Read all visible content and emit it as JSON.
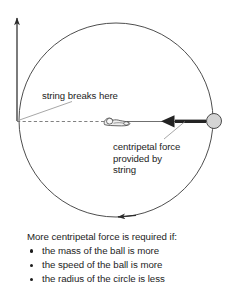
{
  "figure": {
    "title_present": false,
    "annotations": {
      "string_breaks": "string breaks here",
      "centripetal_force_line1": "centripetal force",
      "centripetal_force_line2": "provided by",
      "centripetal_force_line3": "string"
    },
    "elements": {
      "circle_path_name": "circular path of ball",
      "ball_name": "ball",
      "hand_name": "hand holding string",
      "velocity_arrow_name": "tangential velocity arrow",
      "force_arrow_name": "centripetal force arrow",
      "motion_arrow_name": "direction of motion arrow",
      "string_name": "string"
    },
    "colors": {
      "stroke": "#2b2b2b",
      "ball_fill": "#d4d4d4",
      "text": "#1d1d1d",
      "background": "#ffffff"
    },
    "geometry": {
      "center_x": 116,
      "center_y": 120,
      "radius": 97,
      "ball_x": 214,
      "ball_y": 121,
      "ball_radius": 7.5,
      "origin_x": 17,
      "origin_y": 121
    }
  },
  "summary": {
    "heading": "More centripetal force is required if:",
    "bullets": [
      "the mass of the ball is more",
      "the speed of the ball is more",
      "the radius of the circle is less"
    ]
  }
}
